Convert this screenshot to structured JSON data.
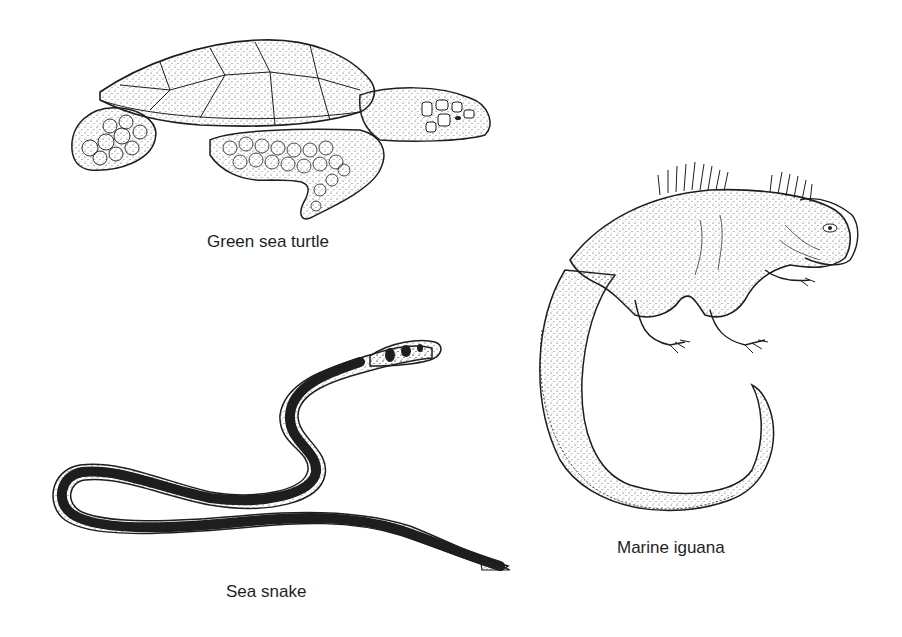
{
  "figures": [
    {
      "id": "turtle",
      "label": "Green sea turtle"
    },
    {
      "id": "iguana",
      "label": "Marine iguana"
    },
    {
      "id": "snake",
      "label": "Sea snake"
    }
  ],
  "colors": {
    "ink": "#1e1e1e",
    "background": "#ffffff",
    "stipple": "#555555"
  }
}
